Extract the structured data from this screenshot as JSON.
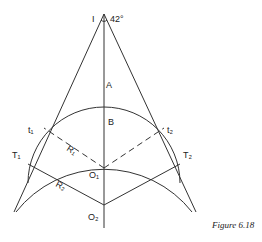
{
  "figure": {
    "caption": "Figure 6.18",
    "labels": {
      "I": "I",
      "angle": "42°",
      "A": "A",
      "B": "B",
      "t1": "t₁",
      "t2": "t₂",
      "T1": "T₁",
      "T2": "T₂",
      "R1": "R₁",
      "R2": "R₂",
      "O1": "O₁",
      "O2": "O₂"
    }
  }
}
